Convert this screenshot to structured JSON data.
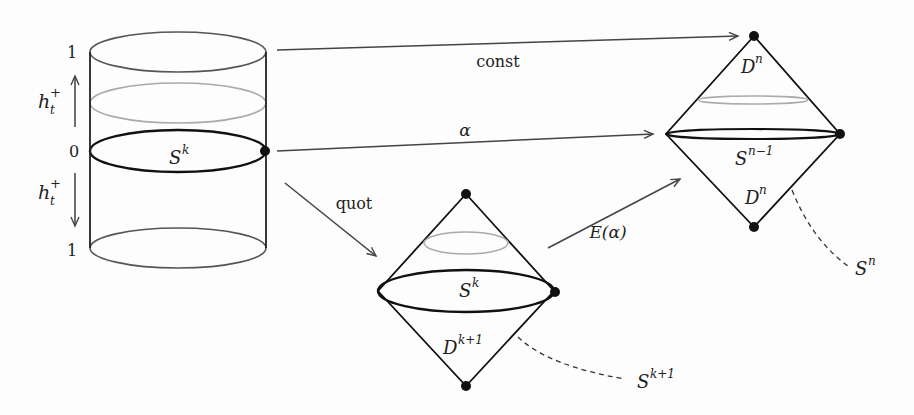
{
  "cylinder": {
    "tick_top": "1",
    "tick_mid": "0",
    "tick_bottom": "1",
    "flow_up_label": "h",
    "flow_up_sub": "t",
    "flow_up_sup": "+",
    "flow_down_label": "h",
    "flow_down_sub": "t",
    "flow_down_sup": "+",
    "sphere_label": "S",
    "sphere_sup": "k"
  },
  "arrows": {
    "const": "const",
    "alpha": "α",
    "quot": "quot",
    "extension": "E(α)"
  },
  "suspension_small": {
    "equator_label": "S",
    "equator_sup": "k",
    "disk_label": "D",
    "disk_sup": "k+1",
    "sphere_label": "S",
    "sphere_sup": "k+1"
  },
  "suspension_large": {
    "top_disk_label": "D",
    "top_disk_sup": "n",
    "equator_label": "S",
    "equator_sup": "n−1",
    "bottom_disk_label": "D",
    "bottom_disk_sup": "n",
    "sphere_label": "S",
    "sphere_sup": "n"
  },
  "colors": {
    "stroke": "#1a1a1a",
    "arrow": "#444444",
    "faint": "#aaaaaa"
  }
}
